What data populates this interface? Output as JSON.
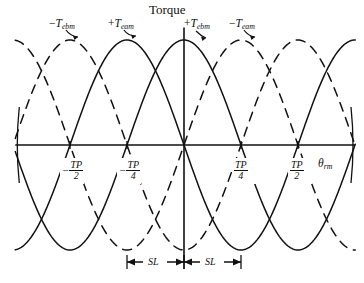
{
  "figure": {
    "type": "line-plot",
    "y_axis_title": "Torque",
    "x_axis_title_base": "θ",
    "x_axis_title_sub": "rm"
  },
  "curve_labels": [
    {
      "id": "neg-tebm",
      "sign": "−",
      "base": "T",
      "sub": "ebm",
      "style": "dashed"
    },
    {
      "id": "pos-team",
      "sign": "+",
      "base": "T",
      "sub": "eam",
      "style": "solid"
    },
    {
      "id": "pos-tebm",
      "sign": "+",
      "base": "T",
      "sub": "ebm",
      "style": "solid"
    },
    {
      "id": "neg-team",
      "sign": "−",
      "base": "T",
      "sub": "eam",
      "style": "dashed"
    }
  ],
  "x_ticks": [
    {
      "id": "tick-neg-tp-2",
      "sign": "−",
      "numerator": "TP",
      "denominator": "2"
    },
    {
      "id": "tick-neg-tp-4",
      "sign": "−",
      "numerator": "TP",
      "denominator": "4"
    },
    {
      "id": "tick-pos-tp-4",
      "sign": "",
      "numerator": "TP",
      "denominator": "4"
    },
    {
      "id": "tick-pos-tp-2",
      "sign": "",
      "numerator": "TP",
      "denominator": "2"
    }
  ],
  "span_labels": [
    {
      "id": "sl-left",
      "text": "SL"
    },
    {
      "id": "sl-right",
      "text": "SL"
    }
  ],
  "colors": {
    "ink": "#111111",
    "background": "#ffffff"
  },
  "chart_data": {
    "type": "line",
    "title": "Torque",
    "xlabel": "θrm",
    "ylabel": "Torque",
    "grid": false,
    "legend": "inline-annotations",
    "x_unit": "TP (tooth pitch)",
    "x_tick_values": [
      -0.5,
      -0.25,
      0,
      0.25,
      0.5
    ],
    "x_tick_labels": [
      "-TP/2",
      "-TP/4",
      "0",
      "TP/4",
      "TP/2"
    ],
    "xlim": [
      -0.74,
      0.75
    ],
    "ylim": [
      -1.15,
      1.15
    ],
    "amplitude": 1.0,
    "period_in_TP": 1.0,
    "series": [
      {
        "name": "+T_eam",
        "style": "solid",
        "form": "cos",
        "phase_deg": 180,
        "peak_x_TP": -0.25,
        "comment": "solid sinusoid peaking at -TP/4, zero at -TP/2 and 0"
      },
      {
        "name": "+T_ebm",
        "style": "solid",
        "form": "cos",
        "phase_deg": 0,
        "peak_x_TP": 0.0,
        "comment": "solid sinusoid peaking at 0 (on the Torque axis)"
      },
      {
        "name": "-T_ebm",
        "style": "dashed",
        "form": "cos",
        "phase_deg": 180,
        "peak_x_TP": -0.5,
        "comment": "dashed sinusoid peaking at -TP/2"
      },
      {
        "name": "-T_eam",
        "style": "dashed",
        "form": "cos",
        "phase_deg": 0,
        "peak_x_TP": 0.25,
        "comment": "dashed sinusoid peaking at +TP/4"
      }
    ],
    "annotations": [
      {
        "text": "SL",
        "from_x_TP": -0.25,
        "to_x_TP": 0.0,
        "kind": "double-arrow-span"
      },
      {
        "text": "SL",
        "from_x_TP": 0.0,
        "to_x_TP": 0.25,
        "kind": "double-arrow-span"
      }
    ]
  }
}
